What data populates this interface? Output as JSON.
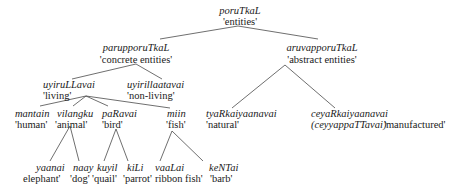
{
  "diagram": {
    "type": "taxonomy-tree",
    "nodes": {
      "root": {
        "term": "poruTkaL",
        "gloss": "'entities'"
      },
      "concrete": {
        "term": "parupporuTkaL",
        "gloss": "'concrete entities'"
      },
      "abstract": {
        "term": "aruvapporuTkaL",
        "gloss": "'abstract entities'"
      },
      "living": {
        "term": "uyiruLLavai",
        "gloss": "'living'"
      },
      "nonliving": {
        "term": "uyirillaatavai",
        "gloss": "'non-living'"
      },
      "human": {
        "term": "mantain",
        "gloss": "'human'"
      },
      "animal": {
        "term": "vilangku",
        "gloss": "'animal'"
      },
      "bird": {
        "term": "paRavai",
        "gloss": "'bird'"
      },
      "fish": {
        "term": "miin",
        "gloss": "'fish'"
      },
      "natural": {
        "term": "tyaRkaiyaanavai",
        "gloss": "'natural'"
      },
      "manufactured": {
        "term": "ceyaRkaiyaanavai",
        "term2": "(ceyyappaTTavai)",
        "gloss": "'manufactured'"
      },
      "elephant": {
        "term": "yaanai",
        "gloss": "elephant'"
      },
      "dog": {
        "term": "naay",
        "gloss": "'dog'"
      },
      "quail": {
        "term": "kuyil",
        "gloss": "'quail'"
      },
      "parrot": {
        "term": "kiLi",
        "gloss": "'parrot'"
      },
      "ribbonfish": {
        "term": "vaaLai",
        "gloss": "ribbon fish'"
      },
      "barb": {
        "term": "keNTai",
        "gloss": "'barb'"
      }
    },
    "edges": [
      [
        "root",
        "concrete"
      ],
      [
        "root",
        "abstract"
      ],
      [
        "concrete",
        "living"
      ],
      [
        "concrete",
        "nonliving"
      ],
      [
        "living",
        "human"
      ],
      [
        "living",
        "animal"
      ],
      [
        "living",
        "bird"
      ],
      [
        "living",
        "fish"
      ],
      [
        "abstract",
        "natural"
      ],
      [
        "abstract",
        "manufactured"
      ],
      [
        "animal",
        "elephant"
      ],
      [
        "animal",
        "dog"
      ],
      [
        "bird",
        "quail"
      ],
      [
        "bird",
        "parrot"
      ],
      [
        "fish",
        "ribbonfish"
      ],
      [
        "fish",
        "barb"
      ]
    ]
  }
}
